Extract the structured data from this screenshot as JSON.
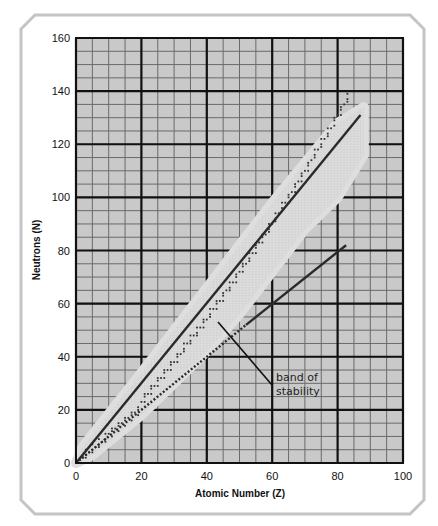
{
  "chart_data": {
    "type": "line",
    "title": "",
    "xlabel": "Atomic Number (Z)",
    "ylabel": "Neutrons (N)",
    "xlim": [
      0,
      100
    ],
    "ylim": [
      0,
      160
    ],
    "x_ticks": [
      0,
      20,
      40,
      60,
      80,
      100
    ],
    "y_ticks": [
      0,
      20,
      40,
      60,
      80,
      100,
      120,
      140,
      160
    ],
    "grid": {
      "major_step_x": 20,
      "minor_step_x": 5,
      "major_step_y": 20,
      "minor_step_y": 5,
      "on": true
    },
    "series": [
      {
        "name": "upper boundary line (N ≈ 1.5Z)",
        "style": "solid",
        "x": [
          0,
          87
        ],
        "y": [
          0,
          131
        ]
      },
      {
        "name": "N = Z line",
        "style": "dotted-then-solid",
        "x": [
          0,
          52,
          82.6
        ],
        "y": [
          0,
          52,
          82
        ]
      },
      {
        "name": "stable nuclei band",
        "style": "shaded-region",
        "polygon": [
          [
            0,
            0
          ],
          [
            2,
            6
          ],
          [
            20,
            34
          ],
          [
            40,
            66
          ],
          [
            60,
            98
          ],
          [
            80,
            128
          ],
          [
            88,
            134
          ],
          [
            88,
            116
          ],
          [
            80,
            100
          ],
          [
            70,
            88
          ],
          [
            60,
            72
          ],
          [
            50,
            56
          ],
          [
            40,
            42
          ],
          [
            20,
            18
          ],
          [
            5,
            3
          ]
        ]
      }
    ],
    "annotations": [
      {
        "text": "band of stability",
        "text_xy": [
          63,
          40
        ],
        "arrow_to": [
          43,
          54
        ]
      }
    ],
    "legend": null
  },
  "labels": {
    "xlabel": "Atomic Number (Z)",
    "ylabel": "Neutrons (N)",
    "annotation_line1": "band of",
    "annotation_line2": "stability",
    "x_ticks": [
      "0",
      "20",
      "40",
      "60",
      "80",
      "100"
    ],
    "y_ticks": [
      "0",
      "20",
      "40",
      "60",
      "80",
      "100",
      "120",
      "140",
      "160"
    ]
  },
  "colors": {
    "plot_bg": "#c9c9c9",
    "band": "#dedede",
    "grid_minor": "#6a6a6a",
    "grid_major": "#111111",
    "line": "#2a2a2a",
    "frame": "#c4c4c4"
  }
}
